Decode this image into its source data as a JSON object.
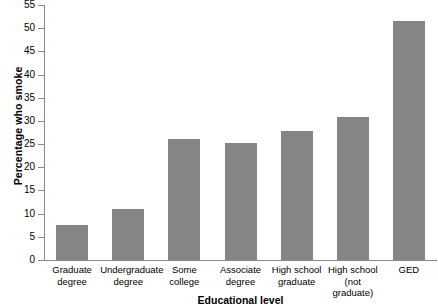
{
  "chart_data": {
    "type": "bar",
    "title": "",
    "xlabel": "Educational level",
    "ylabel": "Percentage who smoke",
    "categories": [
      "Graduate\ndegree",
      "Undergraduate\ndegree",
      "Some\ncollege",
      "Associate\ndegree",
      "High school\ngraduate",
      "High school\n(not graduate)",
      "GED"
    ],
    "values": [
      7.5,
      11,
      26,
      25.3,
      27.8,
      30.8,
      51.5
    ],
    "ylim": [
      0,
      55
    ],
    "ytick_step": 5,
    "ytick_labels": [
      "0",
      "5",
      "10",
      "15",
      "20",
      "25",
      "30",
      "35",
      "40",
      "45",
      "50",
      "55"
    ],
    "grid": false,
    "legend": false,
    "bar_color": "#858585",
    "axis_color": "#8a8a8a",
    "text_color": "#000000",
    "background": "#ffffff"
  }
}
